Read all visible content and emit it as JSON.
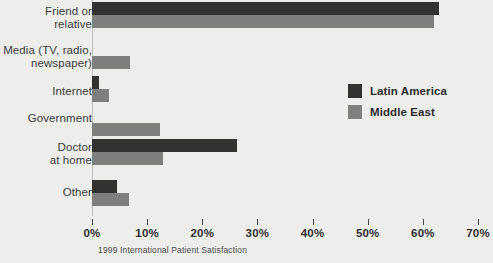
{
  "chart_data": {
    "type": "bar",
    "orientation": "horizontal",
    "title": "",
    "caption": "1999 International Patient Satisfaction",
    "xlabel": "",
    "ylabel": "",
    "xlim": [
      0,
      70
    ],
    "xticks": [
      0,
      10,
      20,
      30,
      40,
      50,
      60,
      70
    ],
    "xtick_labels": [
      "0%",
      "10%",
      "20%",
      "30%",
      "40%",
      "50%",
      "60%",
      "70%"
    ],
    "grid": false,
    "legend_position": "center-right",
    "categories": [
      "Friend or\nrelative",
      "Media (TV, radio,\nnewspaper)",
      "Internet",
      "Government",
      "Doctor\nat home",
      "Other"
    ],
    "series": [
      {
        "name": "Latin America",
        "color": "#323232",
        "values": [
          63.0,
          0.0,
          1.2,
          0.0,
          26.3,
          4.5
        ]
      },
      {
        "name": "Middle East",
        "color": "#7f7f7f",
        "values": [
          62.0,
          6.9,
          3.0,
          12.3,
          12.9,
          6.7
        ]
      }
    ]
  },
  "legend": {
    "items": [
      {
        "label": "Latin America",
        "color": "#323232"
      },
      {
        "label": "Middle East",
        "color": "#7f7f7f"
      }
    ]
  },
  "colors": {
    "background": "#ededec",
    "axis": "#bdbdbd",
    "tick": "#444444",
    "text": "#3b3b3b"
  }
}
